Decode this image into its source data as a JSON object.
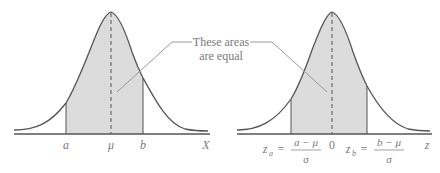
{
  "figure": {
    "callout": {
      "line1": "These areas",
      "line2": "are equal"
    },
    "left_plot": {
      "axis_label": "X",
      "ticks": [
        {
          "name": "a",
          "label": "a"
        },
        {
          "name": "mu",
          "label": "μ"
        },
        {
          "name": "b",
          "label": "b"
        }
      ],
      "shaded_region": "between a and b"
    },
    "right_plot": {
      "axis_label": "z",
      "center_label": "0",
      "za": {
        "lhs": "z",
        "sub": "a",
        "eq": "=",
        "num": "a − μ",
        "den": "σ"
      },
      "zb": {
        "lhs": "z",
        "sub": "b",
        "eq": "=",
        "num": "b − μ",
        "den": "σ"
      },
      "shaded_region": "between z_a and z_b"
    },
    "colors": {
      "curve": "#555555",
      "shade": "#dcdcdc",
      "axis": "#555555",
      "text": "#7a7a7a",
      "callout_line": "#9a9a9a"
    }
  }
}
